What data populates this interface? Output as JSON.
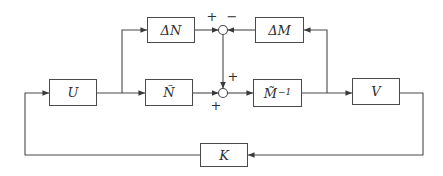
{
  "diagram_title": "coprime-factor-uncertainty-feedback-block-diagram",
  "colors": {
    "background": "#ffffff",
    "line": "#4a4a4a",
    "text": "#2e2e2e"
  },
  "blocks": {
    "delta_n": {
      "label": "ΔN"
    },
    "delta_m": {
      "label": "ΔM"
    },
    "u": {
      "label": "U"
    },
    "n_tilde": {
      "label": "Ñ"
    },
    "m_tilde_inverse": {
      "base": "M̃",
      "exponent": "−1"
    },
    "v": {
      "label": "V"
    },
    "k": {
      "label": "K"
    }
  },
  "junctions": {
    "top": {
      "sign_left": "+",
      "sign_right": "−"
    },
    "middle": {
      "sign_top": "+",
      "sign_left": "+"
    }
  }
}
